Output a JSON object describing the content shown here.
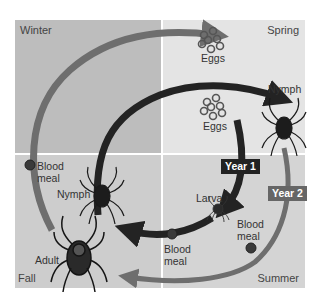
{
  "seasons": {
    "winter": {
      "label": "Winter",
      "color": "#bdbdbd"
    },
    "spring": {
      "label": "Spring",
      "color": "#e4e4e4"
    },
    "fall": {
      "label": "Fall",
      "color": "#cdcdcd"
    },
    "summer": {
      "label": "Summer",
      "color": "#d4d4d4"
    }
  },
  "labels": {
    "eggs_top": "Eggs",
    "eggs_inner": "Eggs",
    "nymph_spring": "Nymph",
    "nymph_fall": "Nymph",
    "larva": "Larva",
    "adult": "Adult",
    "blood_meal_winter": [
      "Blood",
      "meal"
    ],
    "blood_meal_summer_inner": [
      "Blood",
      "meal"
    ],
    "blood_meal_summer_outer": [
      "Blood",
      "meal"
    ]
  },
  "years": {
    "year1": {
      "label": "Year 1",
      "color": "#222222"
    },
    "year2": {
      "label": "Year 2",
      "color": "#666666"
    }
  },
  "arrows": {
    "year1_color": "#232323",
    "year2_color": "#6e6e6e",
    "blood_meal_dot_color": "#3a3a3a"
  }
}
